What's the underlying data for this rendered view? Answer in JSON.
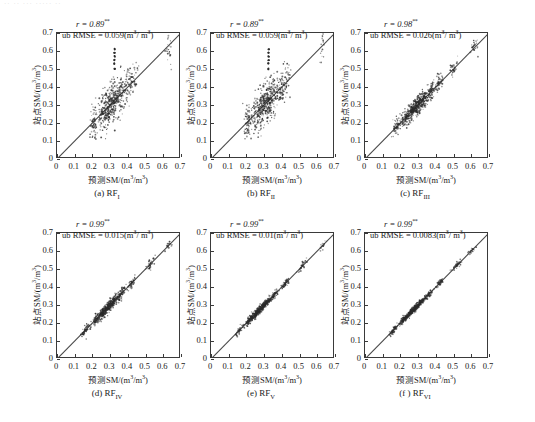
{
  "figure": {
    "top_cropped_text": "·· ·· ··· ····· ··",
    "axis": {
      "x_title_prefix": "预测SM/(m",
      "x_title_mid": "/m",
      "x_title_suffix": ")",
      "y_title_prefix": "站点SM/(m",
      "y_title_mid": "/m",
      "y_title_suffix": ")",
      "superscript": "3",
      "ticks": [
        "0",
        "0.1",
        "0.2",
        "0.3",
        "0.4",
        "0.5",
        "0.6",
        "0.7"
      ],
      "xlim": [
        0,
        0.7
      ],
      "ylim": [
        0,
        0.7
      ]
    },
    "stat_labels": {
      "r_prefix": "r = ",
      "r_star": "**",
      "rmse_prefix": "ub RMSE = ",
      "rmse_unit_open": "(m",
      "rmse_unit_mid": "/ m",
      "rmse_unit_close": ")"
    },
    "panels": [
      {
        "id": "a",
        "caption_prefix": "(a) RF",
        "caption_sub": "I",
        "r": "0.89",
        "rmse": "0.059"
      },
      {
        "id": "b",
        "caption_prefix": "(b) RF",
        "caption_sub": "II",
        "r": "0.89",
        "rmse": "0.059"
      },
      {
        "id": "c",
        "caption_prefix": "(c) RF",
        "caption_sub": "III",
        "r": "0.98",
        "rmse": "0.026"
      },
      {
        "id": "d",
        "caption_prefix": "(d) RF",
        "caption_sub": "IV",
        "r": "0.99",
        "rmse": "0.015"
      },
      {
        "id": "e",
        "caption_prefix": "(e) RF",
        "caption_sub": "V",
        "r": "0.99",
        "rmse": "0.01"
      },
      {
        "id": "f",
        "caption_prefix": "(f ) RF",
        "caption_sub": "VI",
        "r": "0.99",
        "rmse": "0.0083"
      }
    ]
  },
  "chart_data": {
    "type": "scatter",
    "title": "",
    "xlabel": "预测SM/(m3/m3)",
    "ylabel": "站点SM/(m3/m3)",
    "xlim": [
      0,
      0.7
    ],
    "ylim": [
      0,
      0.7
    ],
    "xticks": [
      0,
      0.1,
      0.2,
      0.3,
      0.4,
      0.5,
      0.6,
      0.7
    ],
    "yticks": [
      0,
      0.1,
      0.2,
      0.3,
      0.4,
      0.5,
      0.6,
      0.7
    ],
    "grid": false,
    "legend": "none",
    "reference_line": {
      "type": "1:1",
      "from": [
        0,
        0
      ],
      "to": [
        0.7,
        0.7
      ],
      "color": "#4a4a4a"
    },
    "panels": [
      {
        "name": "(a) RF I",
        "r": 0.89,
        "significance": "**",
        "ub_rmse": 0.059,
        "ub_rmse_units": "m3/m3",
        "n_points": 620,
        "spread_sd": 0.052,
        "cluster_centers": [
          0.21,
          0.255,
          0.285,
          0.31,
          0.335,
          0.36,
          0.4,
          0.43,
          0.63
        ],
        "cluster_weights": [
          0.11,
          0.12,
          0.16,
          0.16,
          0.15,
          0.11,
          0.09,
          0.06,
          0.04
        ],
        "outlier_column": {
          "x": 0.325,
          "y_values": [
            0.5,
            0.53,
            0.55,
            0.57,
            0.59,
            0.61
          ]
        },
        "notes": "broad vertical scatter; widest dispersion of all panels"
      },
      {
        "name": "(b) RF II",
        "r": 0.89,
        "significance": "**",
        "ub_rmse": 0.059,
        "ub_rmse_units": "m3/m3",
        "n_points": 620,
        "spread_sd": 0.052,
        "cluster_centers": [
          0.21,
          0.255,
          0.285,
          0.31,
          0.335,
          0.36,
          0.4,
          0.43,
          0.63
        ],
        "cluster_weights": [
          0.11,
          0.12,
          0.16,
          0.16,
          0.15,
          0.11,
          0.09,
          0.06,
          0.04
        ],
        "outlier_column": {
          "x": 0.325,
          "y_values": [
            0.5,
            0.53,
            0.55,
            0.57,
            0.59,
            0.61
          ]
        },
        "notes": "visually identical to panel (a)"
      },
      {
        "name": "(c) RF III",
        "r": 0.98,
        "significance": "**",
        "ub_rmse": 0.026,
        "ub_rmse_units": "m3/m3",
        "n_points": 700,
        "spread_sd": 0.024,
        "cluster_centers": [
          0.18,
          0.23,
          0.27,
          0.3,
          0.33,
          0.37,
          0.42,
          0.5,
          0.62
        ],
        "cluster_weights": [
          0.08,
          0.14,
          0.18,
          0.18,
          0.15,
          0.11,
          0.08,
          0.05,
          0.03
        ],
        "notes": "dense elliptical cloud hugging the 1:1 line"
      },
      {
        "name": "(d) RF IV",
        "r": 0.99,
        "significance": "**",
        "ub_rmse": 0.015,
        "ub_rmse_units": "m3/m3",
        "n_points": 640,
        "spread_sd": 0.014,
        "cluster_centers": [
          0.16,
          0.22,
          0.26,
          0.29,
          0.32,
          0.36,
          0.42,
          0.52,
          0.63
        ],
        "cluster_weights": [
          0.08,
          0.15,
          0.19,
          0.18,
          0.14,
          0.1,
          0.08,
          0.05,
          0.03
        ],
        "notes": "tight band along 1:1 line"
      },
      {
        "name": "(e) RF V",
        "r": 0.99,
        "significance": "**",
        "ub_rmse": 0.01,
        "ub_rmse_units": "m3/m3",
        "n_points": 640,
        "spread_sd": 0.01,
        "cluster_centers": [
          0.16,
          0.22,
          0.26,
          0.29,
          0.32,
          0.36,
          0.42,
          0.52,
          0.63
        ],
        "cluster_weights": [
          0.08,
          0.15,
          0.19,
          0.18,
          0.14,
          0.1,
          0.08,
          0.05,
          0.03
        ],
        "notes": "tighter than (d)"
      },
      {
        "name": "(f) RF VI",
        "r": 0.99,
        "significance": "**",
        "ub_rmse": 0.0083,
        "ub_rmse_units": "m3/m3",
        "n_points": 640,
        "spread_sd": 0.0085,
        "cluster_centers": [
          0.16,
          0.22,
          0.26,
          0.29,
          0.32,
          0.36,
          0.42,
          0.52,
          0.6
        ],
        "cluster_weights": [
          0.08,
          0.15,
          0.19,
          0.18,
          0.14,
          0.1,
          0.08,
          0.05,
          0.03
        ],
        "notes": "tightest band; near-perfect agreement"
      }
    ]
  }
}
